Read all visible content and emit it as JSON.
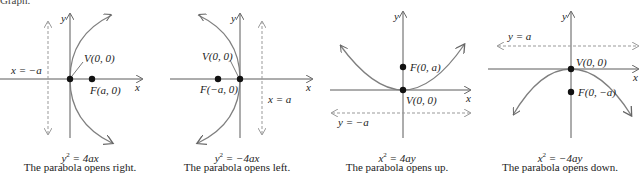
{
  "header": {
    "cut_text": "Graph."
  },
  "colors": {
    "curve": "#7f7f7f",
    "axis": "#5a5a5a",
    "directrix": "#9a9a9a",
    "point": "#111111"
  },
  "panels": [
    {
      "id": "opens-right",
      "equation_lhs": "y",
      "equation_exp": "2",
      "equation_rhs": " = 4ax",
      "description": "The parabola opens right.",
      "vertex_label": "V(0, 0)",
      "focus_label": "F(a, 0)",
      "directrix_label": "x = −a",
      "x_axis_label": "x",
      "y_axis_label": "y"
    },
    {
      "id": "opens-left",
      "equation_lhs": "y",
      "equation_exp": "2",
      "equation_rhs": " = −4ax",
      "description": "The parabola opens left.",
      "vertex_label": "V(0, 0)",
      "focus_label": "F(−a, 0)",
      "directrix_label": "x = a",
      "x_axis_label": "x",
      "y_axis_label": "y"
    },
    {
      "id": "opens-up",
      "equation_lhs": "x",
      "equation_exp": "2",
      "equation_rhs": " = 4ay",
      "description": "The parabola opens up.",
      "vertex_label": "V(0, 0)",
      "focus_label": "F(0, a)",
      "directrix_label": "y = −a",
      "x_axis_label": "x",
      "y_axis_label": "y"
    },
    {
      "id": "opens-down",
      "equation_lhs": "x",
      "equation_exp": "2",
      "equation_rhs": " = −4ay",
      "description": "The parabola opens down.",
      "vertex_label": "V(0, 0)",
      "focus_label": "F(0, −a)",
      "directrix_label": "y = a",
      "x_axis_label": "x",
      "y_axis_label": "y"
    }
  ]
}
